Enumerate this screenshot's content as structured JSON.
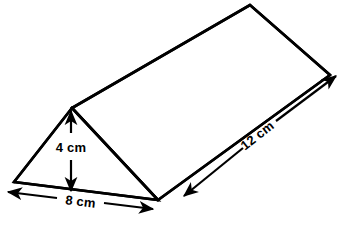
{
  "figure": {
    "name": "triangular-prism",
    "stroke_color": "#000000",
    "fill_color": "#ffffff",
    "background_color": "#ffffff"
  },
  "labels": {
    "height": "4 cm",
    "base": "8 cm",
    "length": "12 cm"
  },
  "dimensions": [
    {
      "id": "height",
      "value": 4,
      "unit": "cm",
      "text": "4 cm",
      "orientation": "vertical"
    },
    {
      "id": "base",
      "value": 8,
      "unit": "cm",
      "text": "8 cm",
      "orientation": "horizontal"
    },
    {
      "id": "length",
      "value": 12,
      "unit": "cm",
      "text": "12 cm",
      "orientation": "diagonal"
    }
  ],
  "geometry": {
    "vertices": {
      "front_apex": [
        72,
        108
      ],
      "front_left": [
        14,
        182
      ],
      "front_right": [
        158,
        200
      ],
      "back_apex": [
        250,
        5
      ],
      "back_right": [
        330,
        75
      ]
    }
  }
}
